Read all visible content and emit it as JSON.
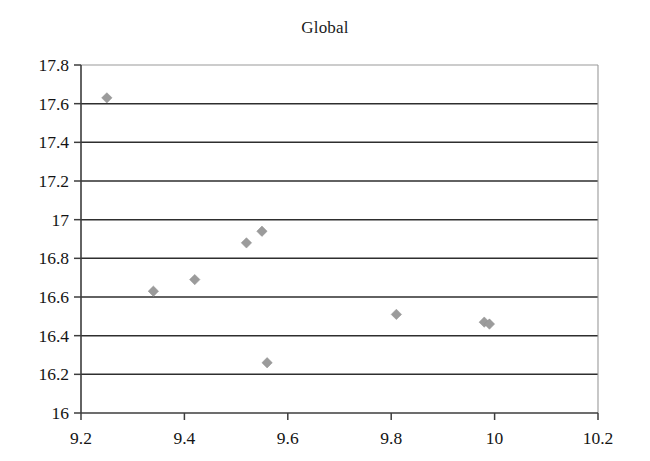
{
  "chart_data": {
    "type": "scatter",
    "title": "Global",
    "xlabel": "",
    "ylabel": "",
    "xlim": [
      9.2,
      10.2
    ],
    "ylim": [
      16,
      17.8
    ],
    "xticks": [
      "9.2",
      "9.4",
      "9.6",
      "9.8",
      "10",
      "10.2"
    ],
    "xtick_values": [
      9.2,
      9.4,
      9.6,
      9.8,
      10.0,
      10.2
    ],
    "yticks": [
      "16",
      "16.2",
      "16.4",
      "16.6",
      "16.8",
      "17",
      "17.2",
      "17.4",
      "17.6",
      "17.8"
    ],
    "ytick_values": [
      16,
      16.2,
      16.4,
      16.6,
      16.8,
      17,
      17.2,
      17.4,
      17.6,
      17.8
    ],
    "grid": "horizontal",
    "legend": "none",
    "marker": "diamond",
    "marker_color": "#9b9b9b",
    "points": [
      {
        "x": 9.25,
        "y": 17.63
      },
      {
        "x": 9.34,
        "y": 16.63
      },
      {
        "x": 9.42,
        "y": 16.69
      },
      {
        "x": 9.52,
        "y": 16.88
      },
      {
        "x": 9.55,
        "y": 16.94
      },
      {
        "x": 9.56,
        "y": 16.26
      },
      {
        "x": 9.81,
        "y": 16.51
      },
      {
        "x": 9.98,
        "y": 16.47
      },
      {
        "x": 9.99,
        "y": 16.46
      }
    ],
    "series": [
      {
        "name": "Global",
        "x": [
          9.25,
          9.34,
          9.42,
          9.52,
          9.55,
          9.56,
          9.81,
          9.98,
          9.99
        ],
        "values": [
          17.63,
          16.63,
          16.69,
          16.88,
          16.94,
          16.26,
          16.51,
          16.47,
          16.46
        ]
      }
    ]
  }
}
